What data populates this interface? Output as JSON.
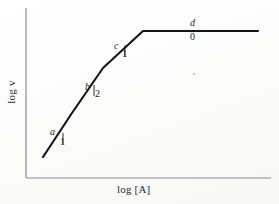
{
  "figure": {
    "background_color": "#fdfdfc",
    "ink_color": "#141414",
    "axis_color": "#8d8d8d"
  },
  "axes": {
    "ylabel": "log v",
    "xlabel": "log [A]",
    "y_axis": {
      "x": 26,
      "y_top": 8,
      "y_bottom": 178
    },
    "x_axis": {
      "y": 178,
      "x_left": 26,
      "x_right": 271
    },
    "ticks": [],
    "grid": false
  },
  "annotations": {
    "a": {
      "label": "a",
      "slope": "1"
    },
    "b": {
      "label": "b",
      "slope": "2"
    },
    "c": {
      "label": "c",
      "slope": "1"
    },
    "d": {
      "label": "d",
      "slope": "0"
    }
  },
  "chart_data": {
    "type": "line",
    "title": "",
    "subtitle": "",
    "xlabel": "log [A]",
    "ylabel": "log v",
    "grid": false,
    "legend_position": "none",
    "xlim": [
      26,
      271
    ],
    "ylim": [
      178,
      8
    ],
    "axis_ticks": {
      "x": [],
      "y": []
    },
    "series": [
      {
        "name": "log v vs log [A]",
        "x": [
          43,
          72,
          103,
          143,
          258
        ],
        "y": [
          157,
          113,
          68,
          31,
          31
        ],
        "points_pixel": [
          [
            43,
            157
          ],
          [
            72,
            113
          ],
          [
            103,
            68
          ],
          [
            143,
            31
          ],
          [
            258,
            31
          ]
        ],
        "segments": [
          {
            "id": "a",
            "slope": 1,
            "from": [
              43,
              157
            ],
            "to": [
              72,
              113
            ],
            "label": "a",
            "slope_label": "1"
          },
          {
            "id": "b",
            "slope": 2,
            "from": [
              72,
              113
            ],
            "to": [
              103,
              68
            ],
            "label": "b",
            "slope_label": "2"
          },
          {
            "id": "c",
            "slope": 1,
            "from": [
              103,
              68
            ],
            "to": [
              143,
              31
            ],
            "label": "c",
            "slope_label": "1"
          },
          {
            "id": "d",
            "slope": 0,
            "from": [
              143,
              31
            ],
            "to": [
              258,
              31
            ],
            "label": "d",
            "slope_label": "0"
          }
        ]
      }
    ],
    "annotations": [
      {
        "text": "a",
        "slope_text": "1",
        "at": [
          50,
          126
        ]
      },
      {
        "text": "b",
        "slope_text": "2",
        "at": [
          85,
          81
        ]
      },
      {
        "text": "c",
        "slope_text": "1",
        "at": [
          114,
          40
        ]
      },
      {
        "text": "d",
        "slope_text": "0",
        "at": [
          190,
          17
        ]
      }
    ]
  }
}
